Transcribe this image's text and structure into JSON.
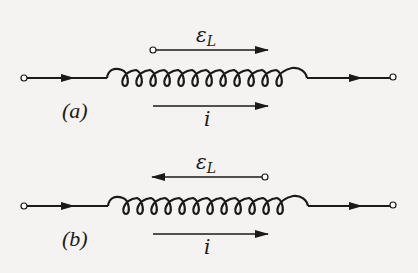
{
  "figure": {
    "panels": [
      {
        "id": "a",
        "label": "(a)",
        "emf_label": "ε",
        "emf_subscript": "L",
        "emf_direction": "right",
        "current_label": "i",
        "current_direction": "right",
        "coil_turns": 12
      },
      {
        "id": "b",
        "label": "(b)",
        "emf_label": "ε",
        "emf_subscript": "L",
        "emf_direction": "left",
        "current_label": "i",
        "current_direction": "right",
        "coil_turns": 12
      }
    ],
    "colors": {
      "ink": "#1a1a1a",
      "background": "#f4f3f1"
    }
  }
}
